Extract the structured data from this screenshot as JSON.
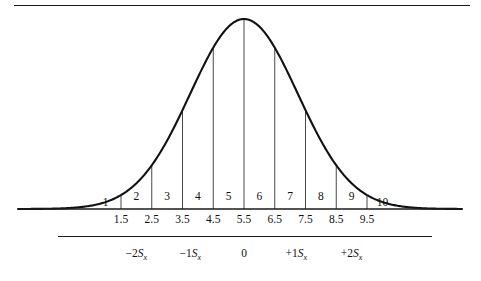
{
  "figure": {
    "title": "",
    "top_rule": true,
    "middle_rule": true
  },
  "chart_data": {
    "type": "area",
    "title": "",
    "subtitle": "",
    "xlabel": "",
    "ylabel": "",
    "curve": {
      "kind": "normal",
      "mean": 5.5,
      "sigma": 1.75,
      "baseline_y": 209,
      "peak_y": 19,
      "x_left_end": 18,
      "x_right_end": 462
    },
    "axis": {
      "x_min": 1.5,
      "x_max": 9.5,
      "grid": false,
      "baseline": true
    },
    "bands": [
      {
        "label": "1",
        "center": 1.0,
        "drop": true
      },
      {
        "label": "2",
        "center": 2.0,
        "drop": true
      },
      {
        "label": "3",
        "center": 3.0,
        "drop": true
      },
      {
        "label": "4",
        "center": 4.0,
        "drop": true
      },
      {
        "label": "5",
        "center": 5.0,
        "drop": true
      },
      {
        "label": "6",
        "center": 6.0,
        "drop": true
      },
      {
        "label": "7",
        "center": 7.0,
        "drop": true
      },
      {
        "label": "8",
        "center": 8.0,
        "drop": true
      },
      {
        "label": "9",
        "center": 9.0,
        "drop": true
      },
      {
        "label": "10",
        "center": 10.0,
        "drop": true
      }
    ],
    "dividers": [
      1.5,
      2.5,
      3.5,
      4.5,
      5.5,
      6.5,
      7.5,
      8.5,
      9.5
    ],
    "tick_labels": [
      "1.5",
      "2.5",
      "3.5",
      "4.5",
      "5.5",
      "6.5",
      "7.5",
      "8.5",
      "9.5"
    ],
    "sd_markers": [
      {
        "text": "−2S",
        "sub": "x",
        "value": -2,
        "x_units": 2.0
      },
      {
        "text": "−1S",
        "sub": "x",
        "value": -1,
        "x_units": 3.75
      },
      {
        "text": "0",
        "sub": "",
        "value": 0,
        "x_units": 5.5
      },
      {
        "text": "+1S",
        "sub": "x",
        "value": 1,
        "x_units": 7.2
      },
      {
        "text": "+2S",
        "sub": "x",
        "value": 2,
        "x_units": 9.0
      }
    ],
    "colors": {
      "curve": "#111111",
      "rule": "#1a1a1a",
      "divider": "#333333",
      "background": "#ffffff"
    }
  }
}
